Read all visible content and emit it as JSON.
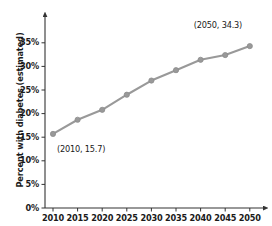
{
  "chart_data": {
    "type": "line",
    "title": "",
    "xlabel": "",
    "ylabel": "Percent with diabetes (estimated)",
    "x": [
      2010,
      2015,
      2020,
      2025,
      2030,
      2035,
      2040,
      2045,
      2050
    ],
    "values": [
      15.7,
      18.7,
      20.8,
      24.0,
      27.0,
      29.2,
      31.4,
      32.4,
      34.3
    ],
    "xticklabels": [
      "2010",
      "2015",
      "2020",
      "2025",
      "2030",
      "2035",
      "2040",
      "2045",
      "2050"
    ],
    "yticklabels": [
      "0%",
      "5%",
      "10%",
      "15%",
      "20%",
      "25%",
      "30%",
      "35%"
    ],
    "yticks": [
      0,
      5,
      10,
      15,
      20,
      25,
      30,
      35
    ],
    "xlim": [
      2007.5,
      2053.5
    ],
    "ylim": [
      0,
      36.5
    ],
    "grid": false,
    "legend": false,
    "series_color": "#999999",
    "marker": "circle",
    "annotations": [
      {
        "label": "(2010, 15.7)",
        "x": 2010,
        "y": 15.7
      },
      {
        "label": "(2050, 34.3)",
        "x": 2050,
        "y": 34.3
      }
    ]
  }
}
